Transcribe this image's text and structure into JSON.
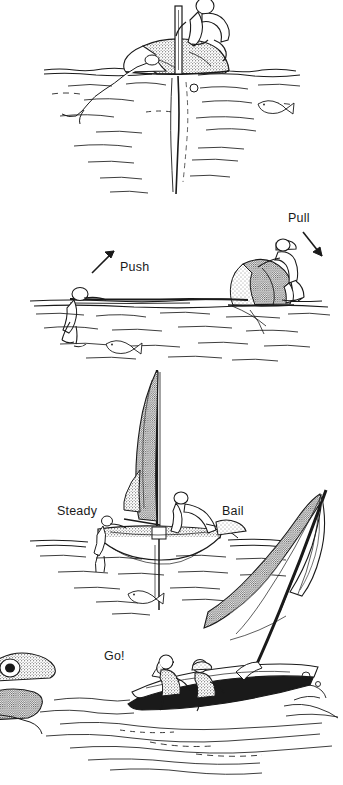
{
  "illustration": {
    "title": "Righting a capsized sailing dinghy",
    "medium": "pen-and-ink line drawing",
    "background_color": "#ffffff",
    "ink_color": "#1a1a1a",
    "panel_count": 4
  },
  "labels": {
    "push": "Push",
    "pull": "Pull",
    "steady": "Steady",
    "bail": "Bail",
    "go": "Go!"
  },
  "panels": [
    {
      "index": 1,
      "caption": "",
      "description": "Capsized dinghy lying on its side, mast and sail submerged below the waterline; one sailor climbs onto the hull gripping the centerboard while a second crew member floats in the water. A small fish swims at right.",
      "figures": [
        "sailor-on-hull",
        "crew-in-water",
        "fish"
      ],
      "elements": [
        "capsized-hull",
        "centerboard",
        "submerged-mast",
        "submerged-sail",
        "waterline",
        "water-ripples"
      ]
    },
    {
      "index": 2,
      "caption": "Push / Pull",
      "description": "Sailor stands on the centerboard and leans back pulling the hull upright while the crew member in the water pushes the masthead up.",
      "figures": [
        "sailor-standing-on-centerboard",
        "crew-pushing-mast",
        "fish"
      ],
      "elements": [
        "righting-hull",
        "centerboard",
        "mast-at-water-level",
        "waterline",
        "push-arrow",
        "pull-arrow"
      ]
    },
    {
      "index": 3,
      "caption": "Steady / Bail",
      "description": "Boat is upright with the sail luffing; one crew steadies the boat from alongside in the water while the other climbs aboard and bails out the water.",
      "figures": [
        "crew-steadying",
        "crew-bailing"
      ],
      "elements": [
        "upright-hull",
        "mast",
        "luffing-sail",
        "boom",
        "centerboard",
        "waterline"
      ]
    },
    {
      "index": 4,
      "caption": "Go!",
      "description": "The dinghy sails away at speed with both crew aboard hiking out, bow wave breaking; a rocky shoreline sits at the lower left.",
      "figures": [
        "helmsman",
        "crew"
      ],
      "elements": [
        "sailing-hull",
        "mast",
        "mainsail",
        "jib",
        "bow-wave",
        "rocky-shore",
        "sea-surface"
      ]
    }
  ],
  "arrows": [
    {
      "name": "push-arrow",
      "direction": "up-right",
      "label": "Push"
    },
    {
      "name": "pull-arrow",
      "direction": "down-right",
      "label": "Pull"
    }
  ]
}
